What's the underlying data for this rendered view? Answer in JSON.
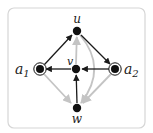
{
  "diagram": {
    "type": "directed-graph",
    "colors": {
      "frame": "#d6d6d6",
      "dark_edge": "#1a1a1a",
      "light_edge": "#c4c4c4",
      "node": "#111111"
    },
    "nodes": [
      {
        "id": "u",
        "label": "u",
        "x": 77,
        "y": 31,
        "style": "plain"
      },
      {
        "id": "v",
        "label": "v",
        "x": 76,
        "y": 69,
        "style": "plain"
      },
      {
        "id": "a1",
        "label": "a",
        "sub": "1",
        "x": 40,
        "y": 69,
        "style": "ringed"
      },
      {
        "id": "a2",
        "label": "a",
        "sub": "2",
        "x": 115,
        "y": 69,
        "style": "ringed"
      },
      {
        "id": "w",
        "label": "w",
        "x": 77,
        "y": 108,
        "style": "plain"
      }
    ],
    "edges": [
      {
        "from": "a1",
        "to": "u",
        "color": "dark"
      },
      {
        "from": "u",
        "to": "a2",
        "color": "dark"
      },
      {
        "from": "a2",
        "to": "v",
        "color": "dark"
      },
      {
        "from": "v",
        "to": "a1",
        "color": "dark"
      },
      {
        "from": "w",
        "to": "v",
        "color": "dark"
      },
      {
        "from": "v",
        "to": "u",
        "color": "light"
      },
      {
        "from": "a1",
        "to": "w",
        "color": "light"
      },
      {
        "from": "a2",
        "to": "w",
        "color": "light"
      },
      {
        "from": "u",
        "to": "w",
        "color": "light",
        "curved": true
      }
    ]
  }
}
